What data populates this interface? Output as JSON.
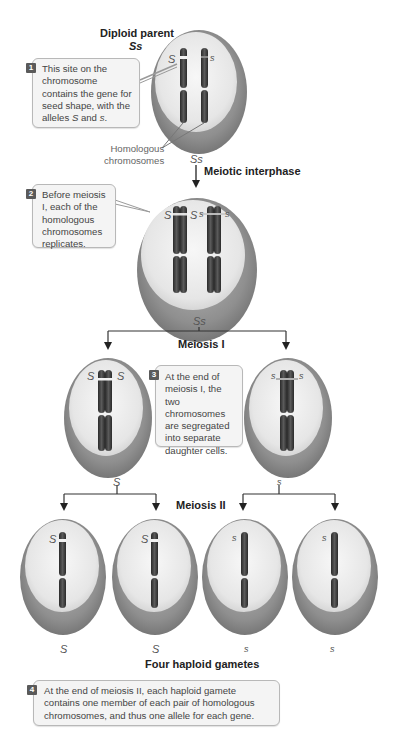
{
  "figure": {
    "stages": {
      "parent_title": "Diploid parent",
      "parent_genotype": "Ss",
      "interphase_label": "Meiotic interphase",
      "interphase_genotype": "Ss",
      "replicated_genotype": "Ss",
      "meiosis1_label": "Meiosis I",
      "meiosis1_left_genotype": "S",
      "meiosis1_right_genotype": "s",
      "meiosis2_label": "Meiosis II",
      "gametes_title": "Four haploid gametes",
      "gametes": [
        "S",
        "S",
        "s",
        "s"
      ]
    },
    "chromosome_labels": {
      "parent_left": "S",
      "parent_right": "s",
      "replicated": [
        "S",
        "S",
        "s",
        "s"
      ],
      "m1_left": [
        "S",
        "S"
      ],
      "m1_right": [
        "s",
        "s"
      ],
      "gamete_labels": [
        "S",
        "S",
        "s",
        "s"
      ]
    },
    "homologous_label_line1": "Homologous",
    "homologous_label_line2": "chromosomes",
    "callouts": [
      {
        "number": "1",
        "text_before": "This site on the chromosome contains the gene for seed shape, with the alleles ",
        "a1": "S",
        "mid": " and ",
        "a2": "s",
        "end": "."
      },
      {
        "number": "2",
        "text": "Before meiosis I, each of the homologous chromosomes replicates."
      },
      {
        "number": "3",
        "text": "At the end of meiosis I, the two chromosomes are segregated into separate daughter cells."
      },
      {
        "number": "4",
        "text": "At the end of meiosis II, each haploid gamete contains one member of each pair of homologous chromosomes, and thus one allele for each gene."
      }
    ],
    "colors": {
      "cell_outer": "#8d8d8d",
      "cell_inner": "#ececec",
      "chromosome": "#3a3a3a",
      "badge": "#5a5a5a",
      "callout_bg": "#f4f4f4"
    }
  }
}
